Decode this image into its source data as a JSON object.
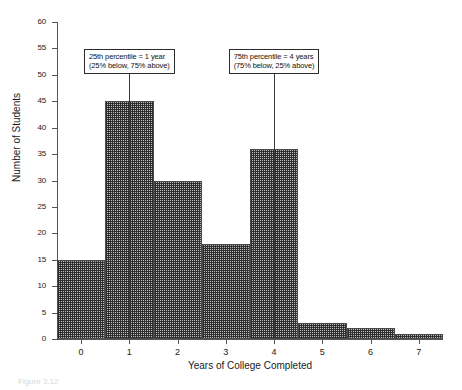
{
  "chart_data": {
    "type": "bar",
    "title": "",
    "xlabel": "Years of College Completed",
    "ylabel": "Number of Students",
    "categories": [
      "0",
      "1",
      "2",
      "3",
      "4",
      "5",
      "6",
      "7"
    ],
    "values": [
      15,
      45,
      30,
      18,
      36,
      3,
      2,
      1
    ],
    "xlim": [
      -0.5,
      7.5
    ],
    "ylim": [
      0,
      60
    ],
    "ytick_labels": [
      "0",
      "5",
      "10",
      "15",
      "20",
      "25",
      "30",
      "35",
      "40",
      "45",
      "50",
      "55",
      "60"
    ],
    "ytick_values": [
      0,
      5,
      10,
      15,
      20,
      25,
      30,
      35,
      40,
      45,
      50,
      55,
      60
    ],
    "xtick_labels": [
      "0",
      "1",
      "2",
      "3",
      "4",
      "5",
      "6",
      "7"
    ],
    "xtick_values": [
      0,
      1,
      2,
      3,
      4,
      5,
      6,
      7
    ],
    "grid": false,
    "legend": "none",
    "bar_fill": "crosshatch",
    "annotations": [
      {
        "name": "25th-percentile",
        "line1": "25th percentile = 1 year",
        "line2": "(25% below, 75% above)",
        "x_value": 1,
        "percentile": 25
      },
      {
        "name": "75th-percentile",
        "line1": "75th percentile = 4 years",
        "line2": "(75% below, 25% above)",
        "x_value": 4,
        "percentile": 75
      }
    ]
  },
  "caption": {
    "text": "Figure 3.12"
  },
  "colors": {
    "axis": "#555555",
    "bar_edge": "#4a4a4a",
    "bar_fill": "#b9b9b9",
    "annotation_border": "#2b2b2b",
    "text": "#1a1a1a"
  }
}
